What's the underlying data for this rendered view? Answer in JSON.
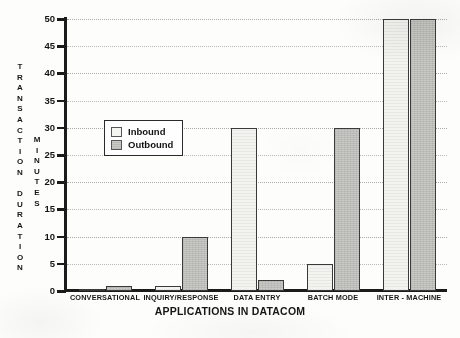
{
  "chart_data": {
    "type": "bar",
    "title": "",
    "subtitle": "",
    "xlabel": "APPLICATIONS IN DATACOM",
    "ylabel": "TRANSACTION DURATION",
    "ylabel_secondary": "MINUTES",
    "ylim": [
      0,
      50
    ],
    "yticks": [
      0,
      5,
      10,
      15,
      20,
      25,
      30,
      35,
      40,
      45,
      50
    ],
    "ytick_labels": [
      "0",
      "5",
      "10",
      "15",
      "20",
      "25",
      "30",
      "35",
      "40",
      "45",
      "50"
    ],
    "grid": true,
    "grid_axis": "y",
    "legend_position": "upper-left-inside",
    "categories": [
      "CONVERSATIONAL",
      "INQUIRY/RESPONSE",
      "DATA ENTRY",
      "BATCH MODE",
      "INTER - MACHINE"
    ],
    "series": [
      {
        "name": "Inbound",
        "color": "#f3f3f0",
        "values": [
          0.3,
          1,
          30,
          5,
          50
        ]
      },
      {
        "name": "Outbound",
        "color": "#c9c9c5",
        "values": [
          1,
          10,
          2,
          30,
          50
        ]
      }
    ]
  },
  "vertical_axis_letters": {
    "duration": "T\nR\nA\nN\nS\nA\nC\nT\nI\nO\nN\n\nD\nU\nR\nA\nT\nI\nO\nN",
    "minutes": "M\nI\nN\nU\nT\nE\nS"
  },
  "legend": {
    "items": [
      {
        "label": "Inbound",
        "swatch": "inbound-swatch"
      },
      {
        "label": "Outbound",
        "swatch": "outbound-swatch"
      }
    ]
  }
}
